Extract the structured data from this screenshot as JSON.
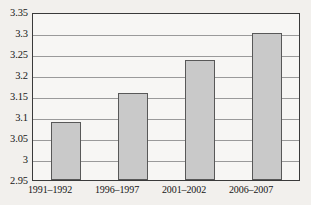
{
  "chart_data": {
    "type": "bar",
    "title": "",
    "xlabel": "",
    "ylabel": "",
    "categories": [
      "1991–1992",
      "1996–1997",
      "2001–2002",
      "2006–2007"
    ],
    "values": [
      3.09,
      3.16,
      3.24,
      3.305
    ],
    "ylim": [
      2.95,
      3.35
    ],
    "ytick_labels": [
      "3.35",
      "3.3",
      "3.25",
      "3.2",
      "3.15",
      "3.1",
      "3.05",
      "3",
      "2.95"
    ],
    "ytick_values": [
      3.35,
      3.3,
      3.25,
      3.2,
      3.15,
      3.1,
      3.05,
      3.0,
      2.95
    ],
    "grid": true,
    "legend": null,
    "colors": {
      "bar_fill": "#c9c9c9",
      "bar_border": "#585858",
      "plot_background": "#f7f6f4",
      "page_background": "#f2f0ed",
      "frame": "#3a3a3a",
      "gridline": "#9a9a9a",
      "text": "#161616"
    }
  }
}
